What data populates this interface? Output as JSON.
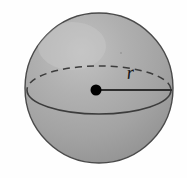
{
  "figure": {
    "type": "geometry-diagram",
    "title": "",
    "background_color": "#fefefe",
    "sphere": {
      "fill_color": "#a3a3a3",
      "highlight_color": "#bdbdbd",
      "outline_color": "#4a4a4a",
      "center_x": 99,
      "center_y": 88,
      "radius_x": 74,
      "radius_y": 75
    },
    "equator": {
      "name": "great-circle",
      "front_arc_style": "solid",
      "back_arc_style": "dashed",
      "stroke_color": "#3c3c3c",
      "dash_pattern": "7 5",
      "ellipse_radius_x": 72,
      "ellipse_radius_y": 24
    },
    "center_point": {
      "label": "",
      "color": "#000000",
      "x": 96,
      "y": 90,
      "radius": 5.5
    },
    "radius_segment": {
      "from_x": 96,
      "from_y": 90,
      "to_x": 172,
      "to_y": 90,
      "stroke_color": "#2e2e2e"
    },
    "labels": {
      "radius": "r"
    }
  }
}
